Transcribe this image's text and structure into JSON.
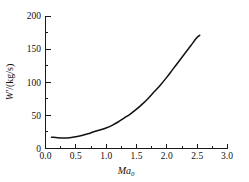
{
  "chart_data": {
    "type": "line",
    "title": "",
    "subtitle": "",
    "xlabel": "Ma",
    "xlabel_sub": "0",
    "ylabel": "W'/(kg/s)",
    "ylabel_main": "W",
    "ylabel_prime": "'",
    "ylabel_units": "/(kg/s)",
    "xlim": [
      0.0,
      3.0
    ],
    "ylim": [
      0,
      200
    ],
    "xticks": [
      0.0,
      0.5,
      1.0,
      1.5,
      2.0,
      2.5,
      3.0
    ],
    "xtick_labels": [
      "0.0",
      "0.5",
      "1.0",
      "1.5",
      "2.0",
      "2.5",
      "3.0"
    ],
    "yticks": [
      0,
      50,
      100,
      150,
      200
    ],
    "ytick_labels": [
      "0",
      "50",
      "100",
      "150",
      "200"
    ],
    "x_minor_tick_count": 1,
    "y_minor_tick_count": 1,
    "grid": false,
    "legend": false,
    "legend_position": "none",
    "series": [
      {
        "name": "W'",
        "color": "#111111",
        "line_width": 1.5,
        "x": [
          0.1,
          0.2,
          0.3,
          0.4,
          0.5,
          0.6,
          0.7,
          0.8,
          0.9,
          1.0,
          1.1,
          1.2,
          1.3,
          1.4,
          1.5,
          1.6,
          1.7,
          1.8,
          1.9,
          2.0,
          2.1,
          2.2,
          2.3,
          2.4,
          2.5,
          2.55
        ],
        "y": [
          17.0,
          16.3,
          16.0,
          16.4,
          17.6,
          19.6,
          22.2,
          25.2,
          28.0,
          31.0,
          35.0,
          40.0,
          46.0,
          52.0,
          59.0,
          67.0,
          76.0,
          86.0,
          96.0,
          107.0,
          119.0,
          131.0,
          143.0,
          155.0,
          167.0,
          171.0
        ]
      }
    ],
    "annotations": []
  },
  "figure": {
    "background": "#ffffff",
    "axis_color": "#1a1a1a",
    "text_color": "#111111"
  }
}
